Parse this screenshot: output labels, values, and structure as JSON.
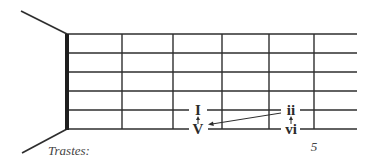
{
  "diagram": {
    "type": "guitar-fretboard",
    "colors": {
      "line": "#2e2e2e",
      "nut": "#1e1e1e",
      "text": "#2b2b2b"
    },
    "strings_y": [
      34,
      53,
      72,
      91,
      110,
      129
    ],
    "nut_x": 67,
    "frets_x": [
      122,
      173,
      222,
      269,
      314
    ],
    "string_end_x": 357,
    "labels": {
      "frets_caption": "Trastes:",
      "fret_number": "5",
      "chord_I": "I",
      "chord_V": "V",
      "chord_ii": "ii",
      "chord_vi": "vi"
    }
  }
}
